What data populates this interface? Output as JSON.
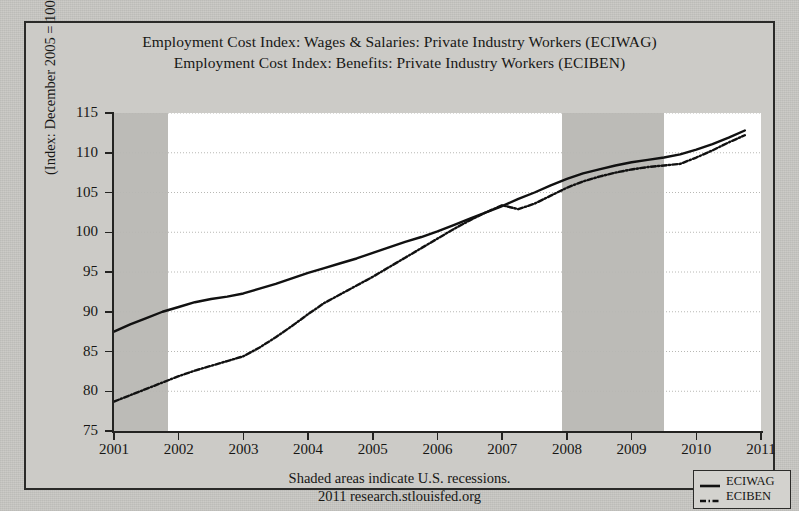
{
  "chart_data": {
    "type": "line",
    "title_lines": [
      "Employment Cost Index: Wages & Salaries: Private Industry Workers (ECIWAG)",
      "Employment Cost Index: Benefits: Private Industry Workers (ECIBEN)"
    ],
    "ylabel": "(Index: December 2005 = 100)",
    "xlabel": "",
    "xlim": [
      2001,
      2011
    ],
    "ylim": [
      75,
      115
    ],
    "ytick_labels": [
      "115",
      "110",
      "105",
      "100",
      "95",
      "90",
      "85",
      "80",
      "75"
    ],
    "ytick_values": [
      115,
      110,
      105,
      100,
      95,
      90,
      85,
      80,
      75
    ],
    "xtick_labels": [
      "2001",
      "2002",
      "2003",
      "2004",
      "2005",
      "2006",
      "2007",
      "2008",
      "2009",
      "2010",
      "2011"
    ],
    "xtick_values": [
      2001,
      2002,
      2003,
      2004,
      2005,
      2006,
      2007,
      2008,
      2009,
      2010,
      2011
    ],
    "grid": "horizontal-dotted",
    "legend_position": "outside-bottom-right",
    "legend": [
      {
        "name": "ECIWAG",
        "style": "solid",
        "color": "#111111"
      },
      {
        "name": "ECIBEN",
        "style": "dash-dot",
        "color": "#111111"
      }
    ],
    "shaded_regions_note": "Shaded areas indicate U.S. recessions.",
    "shaded_regions": [
      {
        "label": "2001 recession",
        "start": 2001.0,
        "end": 2001.83
      },
      {
        "label": "2007-2009 recession",
        "start": 2007.92,
        "end": 2009.5
      }
    ],
    "x": [
      2001.0,
      2001.25,
      2001.5,
      2001.75,
      2002.0,
      2002.25,
      2002.5,
      2002.75,
      2003.0,
      2003.25,
      2003.5,
      2003.75,
      2004.0,
      2004.25,
      2004.5,
      2004.75,
      2005.0,
      2005.25,
      2005.5,
      2005.75,
      2006.0,
      2006.25,
      2006.5,
      2006.75,
      2007.0,
      2007.25,
      2007.5,
      2007.75,
      2008.0,
      2008.25,
      2008.5,
      2008.75,
      2009.0,
      2009.25,
      2009.5,
      2009.75,
      2010.0,
      2010.25,
      2010.5,
      2010.75
    ],
    "series": [
      {
        "name": "ECIWAG",
        "style": "solid",
        "values": [
          87.5,
          88.4,
          89.2,
          90.0,
          90.6,
          91.2,
          91.6,
          91.9,
          92.3,
          92.9,
          93.5,
          94.2,
          94.9,
          95.5,
          96.1,
          96.7,
          97.4,
          98.1,
          98.8,
          99.4,
          100.1,
          100.9,
          101.7,
          102.5,
          103.3,
          104.2,
          105.0,
          105.9,
          106.7,
          107.4,
          107.9,
          108.4,
          108.8,
          109.1,
          109.4,
          109.8,
          110.4,
          111.1,
          111.9,
          112.8
        ]
      },
      {
        "name": "ECIBEN",
        "style": "dash-dot",
        "values": [
          78.7,
          79.5,
          80.3,
          81.1,
          81.9,
          82.6,
          83.2,
          83.8,
          84.4,
          85.5,
          86.8,
          88.2,
          89.7,
          91.1,
          92.2,
          93.3,
          94.4,
          95.6,
          96.8,
          98.0,
          99.2,
          100.4,
          101.5,
          102.5,
          103.4,
          102.9,
          103.6,
          104.6,
          105.6,
          106.4,
          107.0,
          107.5,
          107.9,
          108.2,
          108.4,
          108.6,
          109.4,
          110.3,
          111.3,
          112.2
        ]
      }
    ]
  },
  "footer": {
    "line1": "Shaded areas indicate U.S. recessions.",
    "line2": "2011 research.stlouisfed.org"
  },
  "colors": {
    "paper": "#c9c8c4",
    "plot_background": "#ffffff",
    "recession_shade": "#bcbbb7",
    "axis": "#232321",
    "text": "#161614",
    "series": "#111111"
  }
}
